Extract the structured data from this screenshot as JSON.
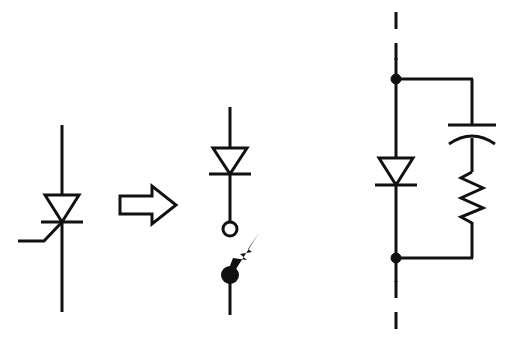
{
  "figure": {
    "background_color": "#ffffff",
    "line_color": "#111111",
    "width": 509,
    "height": 343
  },
  "panels": [
    {
      "id": "left",
      "name": "thyristor-symbol",
      "label": "Thyristor (SCR) symbol",
      "components": [
        {
          "name": "anode-lead",
          "type": "wire"
        },
        {
          "name": "diode-triangle",
          "type": "triangle-outline"
        },
        {
          "name": "cathode-bar",
          "type": "bar"
        },
        {
          "name": "gate-lead",
          "type": "wire"
        },
        {
          "name": "cathode-lead",
          "type": "wire"
        }
      ]
    },
    {
      "id": "arrow",
      "name": "implication-arrow",
      "label": "implies",
      "glyph": "double-right-arrow"
    },
    {
      "id": "middle",
      "name": "diode-switch-model",
      "label": "Ideal diode in series with switch",
      "components": [
        {
          "name": "top-lead",
          "type": "wire"
        },
        {
          "name": "diode-triangle",
          "type": "triangle-outline"
        },
        {
          "name": "cathode-bar",
          "type": "bar"
        },
        {
          "name": "open-terminal",
          "type": "open-circle"
        },
        {
          "name": "switch-blade",
          "type": "tapered-arrow"
        },
        {
          "name": "switch-pivot",
          "type": "filled-circle"
        },
        {
          "name": "bottom-lead",
          "type": "wire"
        }
      ]
    },
    {
      "id": "right",
      "name": "snubber-network",
      "label": "Diode with parallel RC snubber",
      "components": [
        {
          "name": "dashed-top-lead",
          "type": "dashed-wire"
        },
        {
          "name": "top-junction-dot",
          "type": "junction"
        },
        {
          "name": "diode-triangle",
          "type": "triangle-outline"
        },
        {
          "name": "cathode-bar",
          "type": "bar"
        },
        {
          "name": "bottom-junction-dot",
          "type": "junction"
        },
        {
          "name": "dashed-bottom-lead",
          "type": "dashed-wire"
        },
        {
          "name": "top-rail",
          "type": "wire"
        },
        {
          "name": "bottom-rail",
          "type": "wire"
        },
        {
          "name": "capacitor",
          "type": "capacitor-curved"
        },
        {
          "name": "resistor",
          "type": "zigzag"
        }
      ]
    }
  ],
  "geometry": {
    "left": {
      "rail_x": 62,
      "rail_top_y": 125,
      "rail_bottom_y": 312,
      "triangle_top_y": 195,
      "triangle_bottom_y": 222,
      "triangle_half_width": 17,
      "cathode_bar_y": 222,
      "cathode_bar_half_width": 21,
      "gate_corner_x": 44,
      "gate_corner_y": 240,
      "gate_end_x": 18,
      "gate_end_y": 240
    },
    "arrow": {
      "shaft_left_x": 120,
      "tip_x": 176,
      "center_y": 205,
      "shaft_half_height": 9,
      "head_half_height": 19,
      "head_start_x": 152
    },
    "middle": {
      "rail_x": 230,
      "top_lead_y": 107,
      "triangle_top_y": 148,
      "triangle_bottom_y": 173,
      "triangle_half_width": 17,
      "cathode_bar_y": 173,
      "cathode_bar_half_width": 21,
      "open_circle_y": 229,
      "open_circle_r": 7,
      "pivot_y": 275,
      "pivot_r": 9,
      "blade_tip_x": 256,
      "blade_tip_y": 238,
      "bottom_lead_y": 315
    },
    "right": {
      "rail_x": 396,
      "dash_top_y": 12,
      "dash_top_end_y": 79,
      "top_node_y": 79,
      "triangle_top_y": 158,
      "triangle_bottom_y": 185,
      "triangle_half_width": 17,
      "cathode_bar_y": 185,
      "cathode_bar_half_width": 21,
      "bottom_node_y": 258,
      "dash_bottom_end_y": 330,
      "branch_x": 472,
      "cap_plate_y": 125,
      "cap_curve_y": 137,
      "cap_half_width": 24,
      "resistor_top_y": 172,
      "resistor_bottom_y": 218,
      "resistor_amplitude": 11,
      "node_radius": 5
    }
  }
}
